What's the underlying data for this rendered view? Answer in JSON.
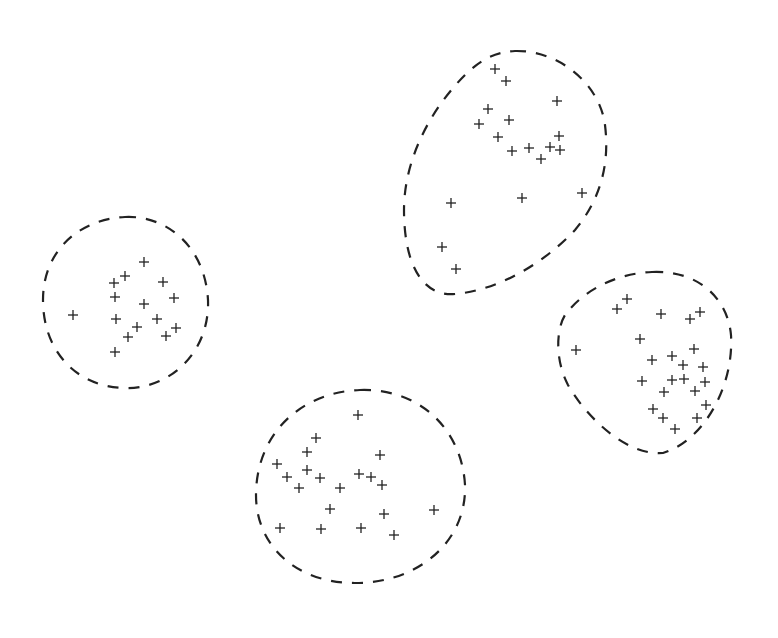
{
  "figure": {
    "type": "cluster-diagram",
    "background": "#ffffff",
    "ink_color": "#222222",
    "marker": "plus",
    "marker_size": 5,
    "clusters": [
      {
        "id": "cluster-left",
        "contour": "M125,217 C165,215 205,245 208,300 C210,352 170,390 123,388 C75,386 43,350 43,300 C43,250 80,219 125,217 Z",
        "points": [
          [
            144,
            262
          ],
          [
            125,
            276
          ],
          [
            114,
            283
          ],
          [
            163,
            282
          ],
          [
            115,
            297
          ],
          [
            174,
            298
          ],
          [
            144,
            304
          ],
          [
            73,
            315
          ],
          [
            116,
            319
          ],
          [
            157,
            319
          ],
          [
            137,
            327
          ],
          [
            176,
            328
          ],
          [
            128,
            337
          ],
          [
            166,
            336
          ],
          [
            115,
            352
          ]
        ]
      },
      {
        "id": "cluster-top",
        "contour": "M515,51 C560,50 600,85 605,125 C610,165 600,200 575,230 C545,262 500,290 455,294 C420,297 404,260 404,210 C404,160 430,110 465,75 C480,60 495,52 515,51 Z",
        "points": [
          [
            495,
            69
          ],
          [
            506,
            81
          ],
          [
            557,
            101
          ],
          [
            488,
            109
          ],
          [
            509,
            120
          ],
          [
            479,
            124
          ],
          [
            498,
            137
          ],
          [
            559,
            136
          ],
          [
            512,
            151
          ],
          [
            529,
            148
          ],
          [
            550,
            147
          ],
          [
            560,
            150
          ],
          [
            541,
            159
          ],
          [
            451,
            203
          ],
          [
            522,
            198
          ],
          [
            582,
            193
          ],
          [
            442,
            247
          ],
          [
            456,
            269
          ]
        ]
      },
      {
        "id": "cluster-right",
        "contour": "M652,272 C700,270 728,300 731,335 C734,385 705,440 663,453 C625,456 585,415 568,385 C555,360 556,330 565,315 C585,288 620,273 652,272 Z",
        "points": [
          [
            627,
            299
          ],
          [
            617,
            309
          ],
          [
            661,
            314
          ],
          [
            700,
            312
          ],
          [
            690,
            319
          ],
          [
            640,
            339
          ],
          [
            576,
            350
          ],
          [
            694,
            349
          ],
          [
            652,
            360
          ],
          [
            672,
            356
          ],
          [
            683,
            365
          ],
          [
            703,
            367
          ],
          [
            642,
            381
          ],
          [
            672,
            380
          ],
          [
            684,
            379
          ],
          [
            705,
            382
          ],
          [
            695,
            391
          ],
          [
            664,
            392
          ],
          [
            653,
            409
          ],
          [
            706,
            405
          ],
          [
            663,
            418
          ],
          [
            697,
            418
          ],
          [
            675,
            429
          ]
        ]
      },
      {
        "id": "cluster-bottom",
        "contour": "M360,390 C420,388 462,430 465,485 C467,540 420,583 355,583 C295,583 256,545 256,495 C256,435 300,392 360,390 Z",
        "points": [
          [
            358,
            415
          ],
          [
            316,
            438
          ],
          [
            380,
            455
          ],
          [
            307,
            452
          ],
          [
            277,
            464
          ],
          [
            307,
            470
          ],
          [
            287,
            477
          ],
          [
            320,
            478
          ],
          [
            359,
            474
          ],
          [
            371,
            477
          ],
          [
            382,
            485
          ],
          [
            299,
            488
          ],
          [
            340,
            488
          ],
          [
            330,
            509
          ],
          [
            384,
            514
          ],
          [
            434,
            510
          ],
          [
            280,
            528
          ],
          [
            321,
            529
          ],
          [
            361,
            528
          ],
          [
            394,
            535
          ]
        ]
      }
    ]
  }
}
